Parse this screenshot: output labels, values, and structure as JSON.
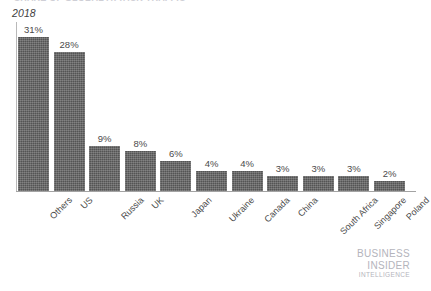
{
  "chart_data": {
    "type": "bar",
    "title": "",
    "title_remnant": "SHARE OF GLOBAL ATTACK TRAFFIC",
    "series_label": "2018",
    "xlabel": "",
    "ylabel": "",
    "ylim": [
      0,
      34
    ],
    "grid": false,
    "legend": "none",
    "value_suffix": "%",
    "categories": [
      "Others",
      "US",
      "Russia",
      "UK",
      "Japan",
      "Ukraine",
      "Canada",
      "China",
      "South Africa",
      "Singapore",
      "Poland"
    ],
    "values": [
      31,
      28,
      9,
      8,
      6,
      4,
      4,
      3,
      3,
      3,
      2
    ],
    "value_labels": [
      "31%",
      "28%",
      "9%",
      "8%",
      "6%",
      "4%",
      "4%",
      "3%",
      "3%",
      "3%",
      "2%"
    ]
  },
  "style": {
    "bar_color": "#545454",
    "axis_color": "#a3a3a3",
    "text_color": "#4a4a4a",
    "watermark_color": "#b4b4bc",
    "background": "#ffffff"
  },
  "watermark": {
    "line1": "BUSINESS",
    "line2": "INSIDER",
    "line3": "INTELLIGENCE"
  }
}
